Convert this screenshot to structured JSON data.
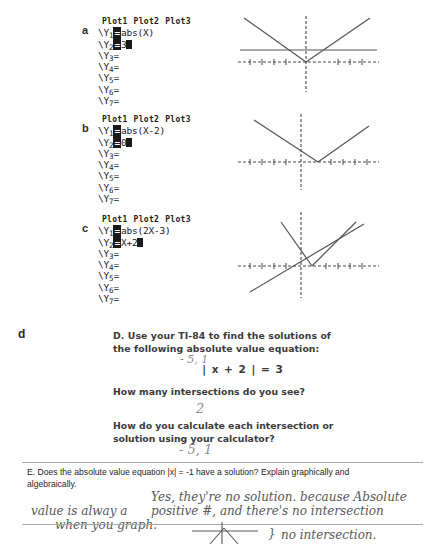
{
  "worksheet": {
    "panels": [
      {
        "label": "a",
        "plots": [
          "Plot1",
          "Plot2",
          "Plot3"
        ],
        "rows": [
          {
            "var": "Y",
            "idx": "1",
            "expr": "abs(X)",
            "cursor": false
          },
          {
            "var": "Y",
            "idx": "2",
            "expr": "3",
            "cursor": true
          },
          {
            "var": "Y",
            "idx": "3",
            "expr": "",
            "cursor": false
          },
          {
            "var": "Y",
            "idx": "4",
            "expr": "",
            "cursor": false
          },
          {
            "var": "Y",
            "idx": "5",
            "expr": "",
            "cursor": false
          },
          {
            "var": "Y",
            "idx": "6",
            "expr": "",
            "cursor": false
          },
          {
            "var": "Y",
            "idx": "7",
            "expr": "",
            "cursor": false
          }
        ],
        "graph_description": "V-shaped absolute value graph with horizontal line y=3 crossing both branches"
      },
      {
        "label": "b",
        "plots": [
          "Plot1",
          "Plot2",
          "Plot3"
        ],
        "rows": [
          {
            "var": "Y",
            "idx": "1",
            "expr": "abs(X-2)",
            "cursor": false
          },
          {
            "var": "Y",
            "idx": "2",
            "expr": "0",
            "cursor": true
          },
          {
            "var": "Y",
            "idx": "3",
            "expr": "",
            "cursor": false
          },
          {
            "var": "Y",
            "idx": "4",
            "expr": "",
            "cursor": false
          },
          {
            "var": "Y",
            "idx": "5",
            "expr": "",
            "cursor": false
          },
          {
            "var": "Y",
            "idx": "6",
            "expr": "",
            "cursor": false
          },
          {
            "var": "Y",
            "idx": "7",
            "expr": "",
            "cursor": false
          }
        ],
        "graph_description": "V-shaped graph shifted right, vertex touching x-axis at x=2, line y=0 along x-axis"
      },
      {
        "label": "c",
        "plots": [
          "Plot1",
          "Plot2",
          "Plot3"
        ],
        "rows": [
          {
            "var": "Y",
            "idx": "1",
            "expr": "abs(2X-3)",
            "cursor": false
          },
          {
            "var": "Y",
            "idx": "2",
            "expr": "X+2",
            "cursor": true
          },
          {
            "var": "Y",
            "idx": "3",
            "expr": "",
            "cursor": false
          },
          {
            "var": "Y",
            "idx": "4",
            "expr": "",
            "cursor": false
          },
          {
            "var": "Y",
            "idx": "5",
            "expr": "",
            "cursor": false
          },
          {
            "var": "Y",
            "idx": "6",
            "expr": "",
            "cursor": false
          },
          {
            "var": "Y",
            "idx": "7",
            "expr": "",
            "cursor": false
          }
        ],
        "graph_description": "Steep narrow V-shaped graph with diagonal line y=X+2 crossing it twice"
      }
    ],
    "section_d": {
      "label": "d",
      "prompt_line1": "D. Use your TI-84 to find the solutions of",
      "prompt_line2": "the following absolute value equation:",
      "equation": "| x + 2 | = 3",
      "answer_equation": "- 5, 1",
      "question1": "How many intersections do you see?",
      "answer1": "2",
      "question2_line1": "How do you calculate each intersection or",
      "question2_line2": "solution using your calculator?",
      "answer2": "- 5, 1"
    },
    "section_e": {
      "prompt_line1": "E. Does the absolute value equation |x| = -1 have a solution? Explain graphically and",
      "prompt_line2": "algebraically.",
      "answer_line1": "Yes, they're no solution. because Absolute",
      "answer_line2_left": "value is alway a",
      "answer_line2_right": "positive #, and there's no intersection",
      "answer_line3": "when you graph.",
      "annotation": "no intersection.",
      "annotation_arrow": "}"
    }
  }
}
